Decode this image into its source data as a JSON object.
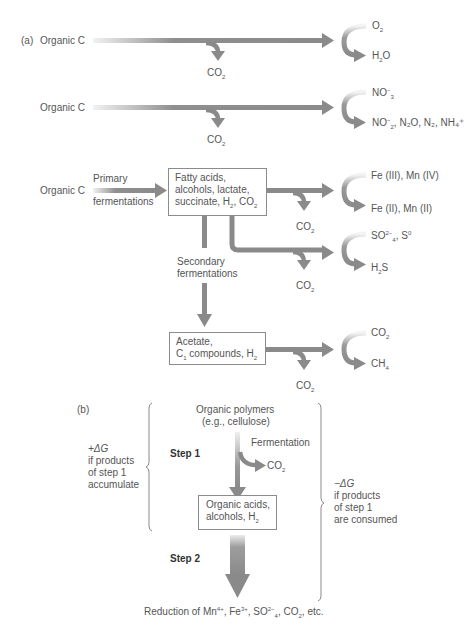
{
  "colors": {
    "arrow": "#8a8a8a",
    "arrow_light": "#e6e6e6",
    "text": "#555555",
    "box_border": "#8c8c8c",
    "brace": "#8a8a8a"
  },
  "part_a": {
    "label": "(a)",
    "rows": [
      {
        "source": "Organic C",
        "byproduct": "CO",
        "byproduct_sub": "2",
        "acceptor_top": {
          "base": "O",
          "sub": "2",
          "sup": ""
        },
        "acceptor_bottom": {
          "text": "H",
          "sub": "2",
          "rest": "O"
        }
      },
      {
        "source": "Organic C",
        "byproduct": "CO",
        "byproduct_sub": "2",
        "acceptor_top": {
          "base": "NO",
          "sub": "3",
          "sup": "−"
        },
        "acceptor_bottom": {
          "text": "NO",
          "sub": "2",
          "sup": "−",
          "rest": ", N₂O, N₂, NH₄⁺"
        }
      }
    ],
    "row3": {
      "source": "Organic C",
      "primary_line1": "Primary",
      "primary_line2": "fermentations",
      "box1": {
        "line1": "Fatty acids,",
        "line2": "alcohols, lactate,",
        "line3_a": "succinate, H",
        "line3_sub": "2",
        "line3_b": ", CO",
        "line3_sub2": "2"
      },
      "fe_top": "Fe (III), Mn (IV)",
      "fe_bottom": "Fe (II), Mn (II)",
      "co2_1": "CO",
      "co2_sub": "2",
      "so4_top": {
        "base": "SO",
        "sub": "4",
        "sup": "2−",
        "rest": ", S",
        "sup2": "0"
      },
      "h2s": {
        "base": "H",
        "sub": "2",
        "rest": "S"
      },
      "co2_2": "CO",
      "secondary_line1": "Secondary",
      "secondary_line2": "fermentations",
      "box2": {
        "line1": "Acetate,",
        "line2_a": "C",
        "line2_sub": "1",
        "line2_b": " compounds, H",
        "line2_sub2": "2"
      },
      "ch_top": "CO",
      "ch_bottom": "CH",
      "ch_bottom_sub": "4",
      "co2_3": "CO"
    }
  },
  "part_b": {
    "label": "(b)",
    "polymers_line1": "Organic polymers",
    "polymers_line2": "(e.g., cellulose)",
    "step1": "Step 1",
    "fermentation": "Fermentation",
    "co2": "CO",
    "co2_sub": "2",
    "box": {
      "line1": "Organic acids,",
      "line2_a": "alcohols, H",
      "line2_sub": "2"
    },
    "step2": "Step 2",
    "left_note": {
      "line1": "+ΔG",
      "line2": "if products",
      "line3": "of step 1",
      "line4": "accumulate"
    },
    "right_note": {
      "line1": "−ΔG",
      "line2": "if products",
      "line3": "of step 1",
      "line4": "are consumed"
    },
    "bottom": {
      "a": "Reduction of Mn",
      "a_sup": "4+",
      "b": ", Fe",
      "b_sup": "3+",
      "c": ", SO",
      "c_sub": "4",
      "c_sup": "2−",
      "d": ", CO",
      "d_sub": "2",
      "e": ", etc."
    }
  }
}
